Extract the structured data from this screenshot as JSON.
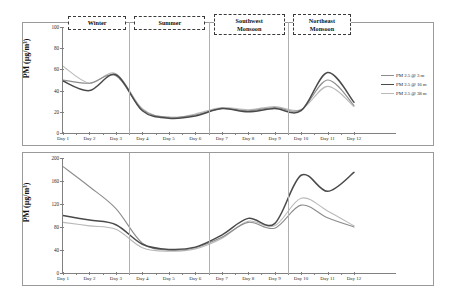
{
  "figure": {
    "panels": [
      {
        "id": "pm25",
        "ylabel": "PM (µg/m³)",
        "yticks": [
          "0",
          "20",
          "40",
          "60",
          "80",
          "100"
        ],
        "xticks": [
          "Day 1",
          "Day 2",
          "Day 3",
          "Day 4",
          "Day 5",
          "Day 6",
          "Day 7",
          "Day 8",
          "Day 9",
          "Day 10",
          "Day 11",
          "Day 12"
        ],
        "legend": [
          {
            "label": "PM 2.5 @ 3 m",
            "color": "#8c8c8c",
            "width": 1.1
          },
          {
            "label": "PM 2.5 @ 16 m",
            "color": "#4a4a4a",
            "width": 1.5
          },
          {
            "label": "PM 2.5 @ 38 m",
            "color": "#b9b9b9",
            "width": 1.1
          }
        ]
      },
      {
        "id": "pm10",
        "ylabel": "PM (µg/m³)",
        "yticks": [
          "0",
          "40",
          "80",
          "120",
          "160",
          "200"
        ],
        "xticks": [
          "Day 1",
          "Day 2",
          "Day 3",
          "Day 4",
          "Day 5",
          "Day 6",
          "Day 7",
          "Day 8",
          "Day 9",
          "Day 10",
          "Day 11",
          "Day 12"
        ],
        "legend": [
          {
            "label": "PM 10 @ 3 m",
            "color": "#8c8c8c",
            "width": 1.1
          },
          {
            "label": "PM 10 @ 16 m",
            "color": "#4a4a4a",
            "width": 1.5
          },
          {
            "label": "PM 10 @ 38 m",
            "color": "#b9b9b9",
            "width": 1.1
          }
        ]
      }
    ],
    "seasons": [
      {
        "name": "Winter",
        "lines": [
          "Winter"
        ],
        "start_day": 1,
        "end_day": 3.5
      },
      {
        "name": "Summer",
        "lines": [
          "Summer"
        ],
        "start_day": 3.5,
        "end_day": 6.5
      },
      {
        "name": "Southwest Monsoon",
        "lines": [
          "Southwest",
          "Monsoon"
        ],
        "start_day": 6.5,
        "end_day": 9.5
      },
      {
        "name": "Northeast Monsoon",
        "lines": [
          "Northeast",
          "Monsoon"
        ],
        "start_day": 9.5,
        "end_day": 12
      }
    ],
    "dividers_at_day": [
      3.5,
      6.5,
      9.5
    ]
  },
  "chart_data": [
    {
      "type": "line",
      "title": "PM 2.5 concentration by sensor height across seasons",
      "xlabel": "",
      "ylabel": "PM (µg/m³)",
      "xlim": [
        1,
        12
      ],
      "ylim": [
        0,
        100
      ],
      "yticks": [
        0,
        20,
        40,
        60,
        80,
        100
      ],
      "grid": false,
      "legend_position": "right",
      "x": [
        "Day 1",
        "Day 2",
        "Day 3",
        "Day 4",
        "Day 5",
        "Day 6",
        "Day 7",
        "Day 8",
        "Day 9",
        "Day 10",
        "Day 11",
        "Day 12"
      ],
      "series": [
        {
          "name": "PM 2.5 @ 3 m",
          "color": "#8c8c8c",
          "values": [
            50,
            47,
            54,
            22,
            15,
            17,
            23,
            21,
            24,
            22,
            50,
            26
          ]
        },
        {
          "name": "PM 2.5 @ 16 m",
          "color": "#4a4a4a",
          "values": [
            49,
            40,
            55,
            21,
            14,
            16,
            23,
            20,
            23,
            21,
            57,
            29
          ]
        },
        {
          "name": "PM 2.5 @ 38 m",
          "color": "#b9b9b9",
          "values": [
            63,
            47,
            56,
            23,
            14,
            18,
            24,
            22,
            25,
            22,
            44,
            25
          ]
        }
      ],
      "annotations": [
        "Winter",
        "Summer",
        "Southwest Monsoon",
        "Northeast Monsoon"
      ]
    },
    {
      "type": "line",
      "title": "PM 10 concentration by sensor height across seasons",
      "xlabel": "",
      "ylabel": "PM (µg/m³)",
      "xlim": [
        1,
        12
      ],
      "ylim": [
        0,
        200
      ],
      "yticks": [
        0,
        40,
        80,
        120,
        160,
        200
      ],
      "grid": false,
      "legend_position": "right",
      "x": [
        "Day 1",
        "Day 2",
        "Day 3",
        "Day 4",
        "Day 5",
        "Day 6",
        "Day 7",
        "Day 8",
        "Day 9",
        "Day 10",
        "Day 11",
        "Day 12"
      ],
      "series": [
        {
          "name": "PM 10 @ 3 m",
          "color": "#8c8c8c",
          "values": [
            185,
            150,
            112,
            52,
            40,
            44,
            62,
            88,
            78,
            118,
            96,
            80
          ]
        },
        {
          "name": "PM 10 @ 16 m",
          "color": "#4a4a4a",
          "values": [
            100,
            92,
            84,
            50,
            41,
            45,
            66,
            95,
            86,
            170,
            142,
            175
          ]
        },
        {
          "name": "PM 10 @ 38 m",
          "color": "#b9b9b9",
          "values": [
            88,
            82,
            76,
            44,
            38,
            42,
            60,
            90,
            82,
            130,
            108,
            82
          ]
        }
      ],
      "annotations": [
        "Winter",
        "Summer",
        "Southwest Monsoon",
        "Northeast Monsoon"
      ]
    }
  ]
}
